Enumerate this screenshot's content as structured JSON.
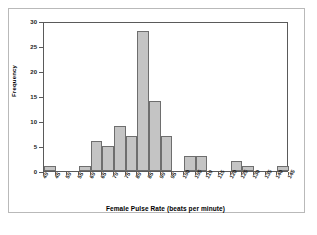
{
  "chart_data": {
    "type": "bar",
    "title": "",
    "xlabel": "Female Pulse Rate (beats per minute)",
    "ylabel": "Frequency",
    "grid": false,
    "legend": "none",
    "xlim": [
      40,
      145
    ],
    "ylim": [
      0,
      30
    ],
    "bin_width": 5,
    "x_tick_labels": [
      "40",
      "45",
      "50",
      "55",
      "60",
      "65",
      "70",
      "75",
      "80",
      "85",
      "90",
      "95",
      "100",
      "105",
      "110",
      "115",
      "120",
      "125",
      "130",
      "135",
      "140",
      "145"
    ],
    "y_tick_labels": [
      "0",
      "5",
      "10",
      "15",
      "20",
      "25",
      "30"
    ],
    "y_ticks": [
      0,
      5,
      10,
      15,
      20,
      25,
      30
    ],
    "bins": [
      {
        "start": 40,
        "end": 45,
        "label": "40-45",
        "value": 1
      },
      {
        "start": 45,
        "end": 50,
        "label": "45-50",
        "value": 0
      },
      {
        "start": 50,
        "end": 55,
        "label": "50-55",
        "value": 0
      },
      {
        "start": 55,
        "end": 60,
        "label": "55-60",
        "value": 1
      },
      {
        "start": 60,
        "end": 65,
        "label": "60-65",
        "value": 6
      },
      {
        "start": 65,
        "end": 70,
        "label": "65-70",
        "value": 5
      },
      {
        "start": 70,
        "end": 75,
        "label": "70-75",
        "value": 9
      },
      {
        "start": 75,
        "end": 80,
        "label": "75-80",
        "value": 7
      },
      {
        "start": 80,
        "end": 85,
        "label": "80-85",
        "value": 28
      },
      {
        "start": 85,
        "end": 90,
        "label": "85-90",
        "value": 14
      },
      {
        "start": 90,
        "end": 95,
        "label": "90-95",
        "value": 7
      },
      {
        "start": 95,
        "end": 100,
        "label": "95-100",
        "value": 0
      },
      {
        "start": 100,
        "end": 105,
        "label": "100-105",
        "value": 3
      },
      {
        "start": 105,
        "end": 110,
        "label": "105-110",
        "value": 3
      },
      {
        "start": 110,
        "end": 115,
        "label": "110-115",
        "value": 0
      },
      {
        "start": 115,
        "end": 120,
        "label": "115-120",
        "value": 0
      },
      {
        "start": 120,
        "end": 125,
        "label": "120-125",
        "value": 2
      },
      {
        "start": 125,
        "end": 130,
        "label": "125-130",
        "value": 1
      },
      {
        "start": 130,
        "end": 135,
        "label": "130-135",
        "value": 0
      },
      {
        "start": 135,
        "end": 140,
        "label": "135-140",
        "value": 0
      },
      {
        "start": 140,
        "end": 145,
        "label": "140-145",
        "value": 1
      }
    ],
    "colors": {
      "bar_fill": "#c4c4c4",
      "bar_border": "#6e6e6e",
      "axis": "#5a5a5a",
      "text": "#000000",
      "frame": "#b9b9b9",
      "background": "#ffffff"
    }
  }
}
